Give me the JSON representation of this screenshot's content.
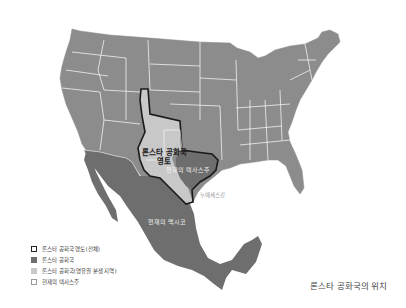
{
  "map": {
    "title": "론스타 공화국의 위치",
    "colors": {
      "us_states": "#8c8c8c",
      "mexico": "#6e6e6e",
      "lone_star_republic": "#6e6e6e",
      "disputed_area": "#c8c8c8",
      "state_borders": "#ffffff",
      "claim_outline": "#1a1a1a",
      "background": "#ffffff"
    },
    "labels": {
      "claimed_territory": "론스타 공화국 영토",
      "claimed_territory_line1": "론스타 공화국",
      "claimed_territory_line2": "영토",
      "current_texas": "현재의 텍사스주",
      "nueces_river": "누에세스강",
      "current_mexico": "현재의 멕시코"
    },
    "legend": [
      {
        "label": "론스타 공화국 영토(전체)",
        "swatch": "outline"
      },
      {
        "label": "론스타 공화국",
        "swatch": "dark"
      },
      {
        "label": "론스타 공화국(영유권 분쟁 지역)",
        "swatch": "light"
      },
      {
        "label": "현재의 텍사스주",
        "swatch": "white"
      }
    ]
  }
}
